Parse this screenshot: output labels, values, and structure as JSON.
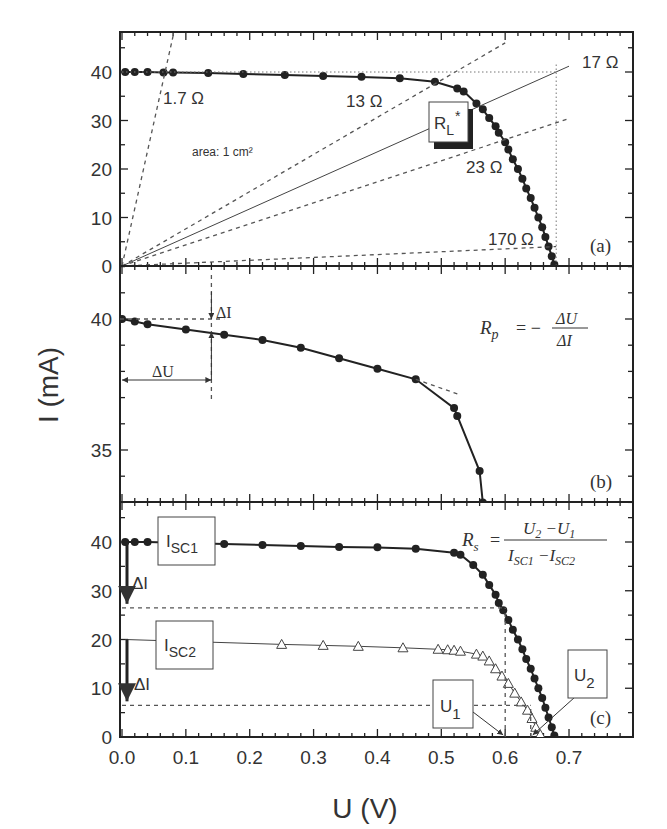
{
  "figure": {
    "ylabel": "I (mA)",
    "xlabel": "U (V)",
    "xticks": [
      "0.0",
      "0.1",
      "0.2",
      "0.3",
      "0.4",
      "0.5",
      "0.6",
      "0.7"
    ],
    "panels": {
      "a": {
        "label": "(a)",
        "yticks": [
          "0",
          "10",
          "20",
          "30",
          "40"
        ],
        "area_note": "area: 1 cm²",
        "load_box": "R",
        "load_box_sub": "L",
        "load_box_sup": "*",
        "resistances": [
          "1.7 Ω",
          "13 Ω",
          "17 Ω",
          "23 Ω",
          "170 Ω"
        ]
      },
      "b": {
        "label": "(b)",
        "yticks": [
          "35",
          "40"
        ],
        "delta_i": "ΔI",
        "delta_u": "ΔU",
        "formula_lhs": "R",
        "formula_lhs_sub": "p",
        "formula_eq": "= −",
        "formula_num": "ΔU",
        "formula_den": "ΔI"
      },
      "c": {
        "label": "(c)",
        "yticks": [
          "0",
          "10",
          "20",
          "30",
          "40"
        ],
        "isc1_box": "I",
        "isc1_sub": "SC1",
        "isc2_box": "I",
        "isc2_sub": "SC2",
        "delta_i_1": "ΔI",
        "delta_i_2": "ΔI",
        "u1_box": "U",
        "u1_sub": "1",
        "u2_box": "U",
        "u2_sub": "2",
        "formula_lhs": "R",
        "formula_lhs_sub": "s",
        "formula_eq": "=",
        "formula_num": "U₂−U₁",
        "formula_den": "I_SC1−I_SC2"
      }
    }
  },
  "chart_data": [
    {
      "type": "line",
      "panel": "(a)",
      "title": "I-V curve with load lines",
      "xlabel": "U (V)",
      "ylabel": "I (mA)",
      "xlim": [
        0.0,
        0.8
      ],
      "ylim": [
        0,
        48
      ],
      "annotations": [
        "area: 1 cm²",
        "R_L*",
        "1.7 Ω",
        "13 Ω",
        "17 Ω",
        "23 Ω",
        "170 Ω"
      ],
      "series": [
        {
          "name": "I-V curve",
          "marker": "filled-circle",
          "x": [
            0.005,
            0.02,
            0.04,
            0.065,
            0.08,
            0.135,
            0.19,
            0.255,
            0.315,
            0.375,
            0.435,
            0.49,
            0.525,
            0.535,
            0.555,
            0.565,
            0.575,
            0.585,
            0.59,
            0.6,
            0.605,
            0.612,
            0.62,
            0.627,
            0.633,
            0.64,
            0.646,
            0.652,
            0.658,
            0.663,
            0.668,
            0.673,
            0.677
          ],
          "y": [
            40,
            40,
            40,
            39.9,
            39.9,
            39.8,
            39.6,
            39.4,
            39.2,
            39.0,
            38.7,
            38.0,
            36.6,
            36.0,
            33.5,
            32.3,
            30.5,
            28.8,
            27.5,
            25.5,
            24,
            22,
            20,
            18,
            16,
            14,
            12,
            10,
            8,
            6,
            4,
            2,
            0.3
          ]
        },
        {
          "name": "1.7 Ω load line",
          "style": "dashed",
          "x": [
            0,
            0.081
          ],
          "y": [
            0,
            48
          ]
        },
        {
          "name": "13 Ω load line",
          "style": "dashed",
          "x": [
            0,
            0.6
          ],
          "y": [
            0,
            46
          ]
        },
        {
          "name": "17 Ω load line",
          "style": "solid",
          "x": [
            0,
            0.7
          ],
          "y": [
            0,
            41.2
          ]
        },
        {
          "name": "23 Ω load line",
          "style": "dashed",
          "x": [
            0,
            0.7
          ],
          "y": [
            0,
            30.4
          ]
        },
        {
          "name": "170 Ω load line",
          "style": "dashed",
          "x": [
            0,
            0.68
          ],
          "y": [
            0,
            4.0
          ]
        },
        {
          "name": "Isc reference",
          "style": "dotted",
          "x": [
            0,
            0.68
          ],
          "y": [
            40,
            40
          ]
        },
        {
          "name": "Voc reference",
          "style": "dotted",
          "x": [
            0.68,
            0.68
          ],
          "y": [
            0,
            42
          ]
        }
      ]
    },
    {
      "type": "line",
      "panel": "(b)",
      "title": "Parallel resistance from slope near Isc",
      "xlabel": "U (V)",
      "ylabel": "I (mA)",
      "xlim": [
        0.0,
        0.8
      ],
      "ylim": [
        33,
        42
      ],
      "annotations": [
        "ΔI",
        "ΔU",
        "R_p = −ΔU/ΔI"
      ],
      "series": [
        {
          "name": "I-V curve (zoom)",
          "marker": "filled-circle",
          "x": [
            0.0,
            0.02,
            0.04,
            0.1,
            0.16,
            0.22,
            0.28,
            0.34,
            0.4,
            0.46,
            0.52,
            0.525,
            0.56,
            0.565
          ],
          "y": [
            40.0,
            39.9,
            39.8,
            39.6,
            39.4,
            39.2,
            38.9,
            38.5,
            38.1,
            37.7,
            36.6,
            36.3,
            34.2,
            33.0
          ]
        },
        {
          "name": "Tangent",
          "style": "dashed",
          "x": [
            0.46,
            0.53
          ],
          "y": [
            37.7,
            37.1
          ]
        }
      ]
    },
    {
      "type": "line",
      "panel": "(c)",
      "title": "Series resistance from two illumination levels",
      "xlabel": "U (V)",
      "ylabel": "I (mA)",
      "xlim": [
        0.0,
        0.8
      ],
      "ylim": [
        0,
        48
      ],
      "annotations": [
        "I_SC1",
        "I_SC2",
        "ΔI",
        "ΔI",
        "U_1",
        "U_2",
        "R_s = (U_2 − U_1)/(I_SC1 − I_SC2)"
      ],
      "series": [
        {
          "name": "I_SC1 curve",
          "marker": "filled-circle",
          "x": [
            0.005,
            0.02,
            0.04,
            0.16,
            0.22,
            0.28,
            0.34,
            0.4,
            0.46,
            0.52,
            0.53,
            0.55,
            0.565,
            0.575,
            0.585,
            0.59,
            0.597,
            0.605,
            0.612,
            0.62,
            0.627,
            0.633,
            0.64,
            0.646,
            0.652,
            0.658,
            0.663,
            0.668,
            0.673,
            0.677
          ],
          "y": [
            40,
            40,
            40,
            39.6,
            39.4,
            39.2,
            39.0,
            38.9,
            38.6,
            37.8,
            37.4,
            35.3,
            33.3,
            31.2,
            29.2,
            27.5,
            26,
            24,
            22,
            20,
            18,
            16,
            14,
            12,
            10,
            8,
            6,
            4,
            2,
            0.3
          ]
        },
        {
          "name": "I_SC2 curve",
          "marker": "open-triangle",
          "x": [
            0.25,
            0.315,
            0.37,
            0.44,
            0.495,
            0.51,
            0.52,
            0.53,
            0.555,
            0.565,
            0.575,
            0.585,
            0.595,
            0.605,
            0.615,
            0.625,
            0.635,
            0.642,
            0.648,
            0.655
          ],
          "y": [
            19.0,
            18.8,
            18.6,
            18.3,
            18.0,
            17.9,
            17.8,
            17.6,
            17.0,
            16.6,
            15.6,
            14.0,
            12.5,
            11.0,
            9.0,
            7.2,
            5.5,
            3.8,
            2.0,
            0.5
          ]
        },
        {
          "name": "I_SC1 − ΔI level",
          "style": "dashed",
          "x": [
            0,
            0.6
          ],
          "y": [
            26.5,
            26.5
          ]
        },
        {
          "name": "I_SC2 − ΔI level",
          "style": "dashed",
          "x": [
            0,
            0.64
          ],
          "y": [
            6.5,
            6.5
          ]
        },
        {
          "name": "U_1 marker",
          "style": "dashed",
          "x": [
            0.6,
            0.6
          ],
          "y": [
            0,
            26.5
          ]
        },
        {
          "name": "U_2 marker",
          "style": "dashed",
          "x": [
            0.64,
            0.64
          ],
          "y": [
            0,
            6.5
          ]
        }
      ]
    }
  ]
}
